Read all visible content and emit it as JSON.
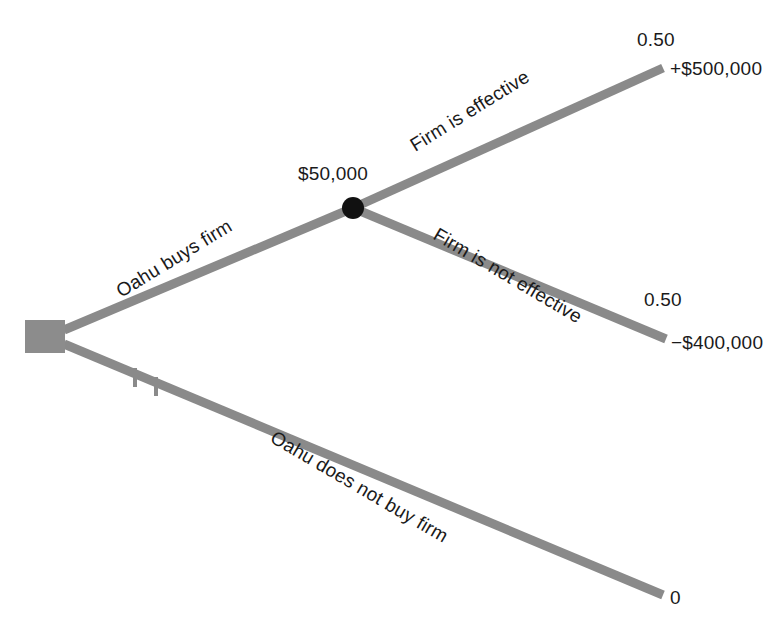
{
  "diagram": {
    "type": "decision-tree",
    "title": "",
    "colors": {
      "branch": "#8a8a8a",
      "decision_node": "#8c8c8c",
      "chance_node": "#111111",
      "text": "#1a1a1a",
      "background": "#ffffff"
    },
    "decision_node": {
      "shape": "square",
      "label": ""
    },
    "chance_node": {
      "shape": "circle",
      "expected_value": "$50,000"
    },
    "branches": [
      {
        "id": "buy-firm",
        "label": "Oahu buys firm",
        "from": "decision-node",
        "to": "chance-node",
        "pruned": false
      },
      {
        "id": "firm-effective",
        "label": "Firm is effective",
        "from": "chance-node",
        "to": "payoff-up",
        "probability": "0.50",
        "payoff": "+$500,000",
        "pruned": false
      },
      {
        "id": "firm-not-effective",
        "label": "Firm is not effective",
        "from": "chance-node",
        "to": "payoff-down",
        "probability": "0.50",
        "payoff": "−$400,000",
        "pruned": false
      },
      {
        "id": "do-not-buy-firm",
        "label": "Oahu does not buy firm",
        "from": "decision-node",
        "to": "payoff-none",
        "payoff": "0",
        "pruned": true,
        "prune_marks": 2
      }
    ],
    "probabilities": {
      "effective": "0.50",
      "not_effective": "0.50"
    },
    "payoffs": {
      "effective": "+$500,000",
      "not_effective": "−$400,000",
      "no_purchase": "0"
    }
  }
}
